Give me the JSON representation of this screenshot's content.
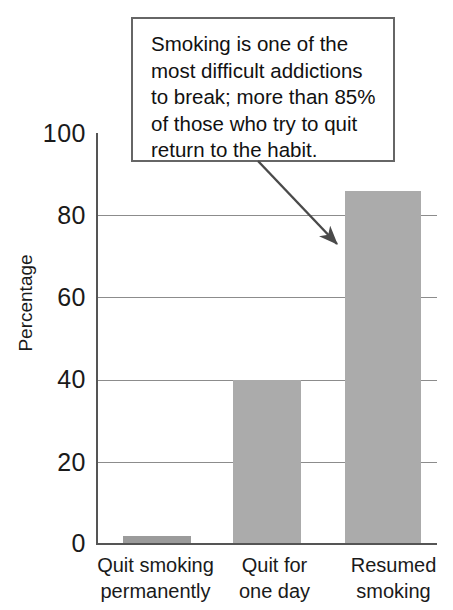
{
  "chart_data": {
    "type": "bar",
    "title": "",
    "xlabel": "",
    "ylabel": "Percentage",
    "categories": [
      "Quit smoking permanently",
      "Quit for one day",
      "Resumed smoking"
    ],
    "category_lines": [
      [
        "Quit smoking",
        "permanently"
      ],
      [
        "Quit for",
        "one day"
      ],
      [
        "Resumed",
        "smoking"
      ]
    ],
    "values": [
      2,
      40,
      86
    ],
    "ylim": [
      0,
      100
    ],
    "yticks": [
      100,
      80,
      60,
      40,
      20,
      0
    ],
    "grid": true,
    "legend": "none",
    "bar_color": "#ababab",
    "annotations": [
      {
        "name": "callout",
        "text": "Smoking is one of the most difficult addictions to break; more than 85% of those who try to quit return to the habit.",
        "lines": [
          "Smoking is one of the",
          "most difficult addictions",
          "to break; more than 85%",
          "of those who try to quit",
          "return to the habit."
        ],
        "points_to": "Resumed smoking"
      }
    ]
  },
  "colors": {
    "bar": "#ababab",
    "bar_first": "#9b9b9b",
    "grid": "#8c8c8c",
    "axis": "#555555",
    "callout_border": "#666666",
    "text": "#1a1a1a",
    "background": "#ffffff"
  }
}
